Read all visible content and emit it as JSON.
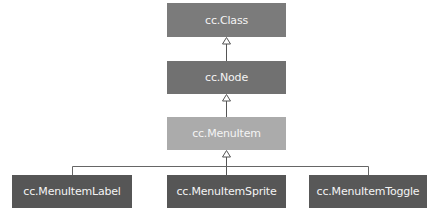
{
  "diagram": {
    "type": "class-inheritance",
    "nodes": [
      {
        "id": "class",
        "label": "cc.Class",
        "color": "#7b7b7b"
      },
      {
        "id": "node",
        "label": "cc.Node",
        "color": "#717171"
      },
      {
        "id": "menuitem",
        "label": "cc.MenuItem",
        "color": "#ababab"
      },
      {
        "id": "menuitemlabel",
        "label": "cc.MenuItemLabel",
        "color": "#565656"
      },
      {
        "id": "menuitemsprite",
        "label": "cc.MenuItemSprite",
        "color": "#565656"
      },
      {
        "id": "menuitemtoggle",
        "label": "cc.MenuItemToggle",
        "color": "#585858"
      }
    ],
    "edges": [
      {
        "from": "node",
        "to": "class",
        "kind": "inherits"
      },
      {
        "from": "menuitem",
        "to": "node",
        "kind": "inherits"
      },
      {
        "from": "menuitemlabel",
        "to": "menuitem",
        "kind": "inherits"
      },
      {
        "from": "menuitemsprite",
        "to": "menuitem",
        "kind": "inherits"
      },
      {
        "from": "menuitemtoggle",
        "to": "menuitem",
        "kind": "inherits"
      }
    ]
  }
}
